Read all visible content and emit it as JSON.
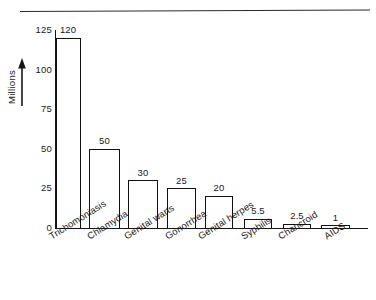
{
  "chart_data": {
    "type": "bar",
    "title": "",
    "subtitle": "",
    "xlabel": "",
    "ylabel": "Millions",
    "categories": [
      "Trichomoniasis",
      "Chlamydia",
      "Genital warts",
      "Gonorrhea",
      "Genital herpes",
      "Syphilis",
      "Chancroid",
      "AIDS"
    ],
    "values": [
      120,
      50,
      30,
      25,
      20,
      5.5,
      2.5,
      1
    ],
    "value_labels": [
      "120",
      "50",
      "30",
      "25",
      "20",
      "5.5",
      "2.5",
      "1"
    ],
    "ylim": [
      0,
      125
    ],
    "yticks": [
      0,
      25,
      50,
      75,
      100,
      125
    ],
    "ytick_labels": [
      "0",
      "25",
      "50",
      "75",
      "100",
      "125"
    ],
    "grid": false,
    "legend": false,
    "legend_position": "none",
    "bar_fill": "#ffffff",
    "bar_edge": "#111111",
    "axis_color": "#161616",
    "background": "#ffffff",
    "axis_arrow_icon": "up-arrow-icon",
    "x_label_rotation_deg": -32
  }
}
